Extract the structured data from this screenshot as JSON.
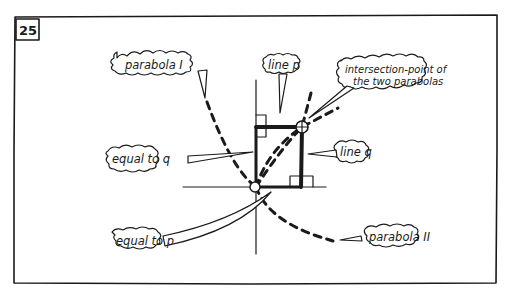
{
  "panel": {
    "number": "25"
  },
  "labels": {
    "parabola_1": "parabola I",
    "line_p": "line p",
    "intersection_line1": "intersection-point of",
    "intersection_line2": "the two parabolas",
    "equal_to_q": "equal to q",
    "line_q": "line q",
    "equal_to_p": "equal to p",
    "parabola_2": "parabola II"
  },
  "colors": {
    "ink": "#1a1a1a",
    "paper": "#ffffff"
  }
}
